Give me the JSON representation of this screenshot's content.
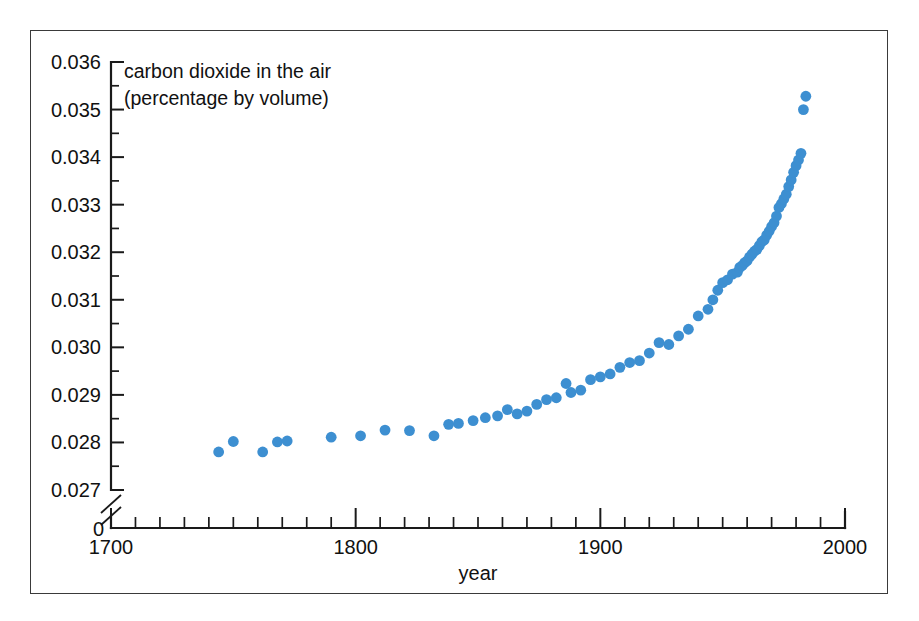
{
  "figure": {
    "frame_border_color": "#3a3a3a",
    "background_color": "#ffffff"
  },
  "annotation": {
    "line1": "carbon dioxide in the air",
    "line2": "(percentage by volume)"
  },
  "axes": {
    "x_title": "year",
    "y_zero_label": "0",
    "x_tick_labels": [
      "1700",
      "1800",
      "1900",
      "2000"
    ],
    "y_tick_labels": [
      "0.027",
      "0.028",
      "0.029",
      "0.030",
      "0.031",
      "0.032",
      "0.033",
      "0.034",
      "0.035",
      "0.036"
    ]
  },
  "chart_data": {
    "type": "scatter",
    "title": "carbon dioxide in the air (percentage by volume)",
    "xlabel": "year",
    "ylabel": "carbon dioxide in the air (percentage by volume)",
    "xlim": [
      1700,
      2000
    ],
    "ylim": [
      0.027,
      0.036
    ],
    "y_axis_break": true,
    "y_axis_break_note": "axis broken between 0 and 0.027",
    "x_major_ticks": [
      1700,
      1800,
      1900,
      2000
    ],
    "x_minor_tick_step": 10,
    "y_major_ticks": [
      0.027,
      0.028,
      0.029,
      0.03,
      0.031,
      0.032,
      0.033,
      0.034,
      0.035,
      0.036
    ],
    "y_minor_tick_step": 0.0005,
    "grid": false,
    "legend": null,
    "marker": {
      "shape": "circle",
      "color": "#3d8fd1",
      "radius_px": 5.4
    },
    "series": [
      {
        "name": "carbon dioxide concentration",
        "units": "percent by volume",
        "x": [
          1744,
          1750,
          1762,
          1768,
          1772,
          1790,
          1802,
          1812,
          1822,
          1832,
          1838,
          1842,
          1848,
          1853,
          1858,
          1862,
          1866,
          1870,
          1874,
          1878,
          1882,
          1886,
          1888,
          1892,
          1896,
          1900,
          1904,
          1908,
          1912,
          1916,
          1920,
          1924,
          1928,
          1932,
          1936,
          1940,
          1944,
          1946,
          1948,
          1950,
          1952,
          1954,
          1956,
          1957,
          1958,
          1959,
          1960,
          1961,
          1962,
          1963,
          1964,
          1965,
          1966,
          1967,
          1968,
          1969,
          1970,
          1971,
          1972,
          1973,
          1974,
          1975,
          1976,
          1977,
          1978,
          1979,
          1980,
          1981,
          1982,
          1983,
          1984
        ],
        "y": [
          0.0278,
          0.02802,
          0.0278,
          0.02801,
          0.02803,
          0.02811,
          0.02814,
          0.02826,
          0.02825,
          0.02814,
          0.02838,
          0.0284,
          0.02846,
          0.02852,
          0.02856,
          0.02869,
          0.0286,
          0.02866,
          0.0288,
          0.0289,
          0.02894,
          0.02924,
          0.02905,
          0.0291,
          0.02932,
          0.02938,
          0.02944,
          0.02958,
          0.02968,
          0.02972,
          0.02988,
          0.0301,
          0.03006,
          0.03024,
          0.03038,
          0.03066,
          0.0308,
          0.031,
          0.0312,
          0.03136,
          0.03142,
          0.03154,
          0.03158,
          0.03168,
          0.03172,
          0.03178,
          0.03182,
          0.0319,
          0.03196,
          0.03202,
          0.03206,
          0.03214,
          0.03222,
          0.03226,
          0.03236,
          0.03244,
          0.03254,
          0.03262,
          0.03276,
          0.03294,
          0.03302,
          0.03312,
          0.03322,
          0.03338,
          0.03352,
          0.03368,
          0.03382,
          0.03394,
          0.03408,
          0.035,
          0.03528
        ]
      }
    ]
  }
}
